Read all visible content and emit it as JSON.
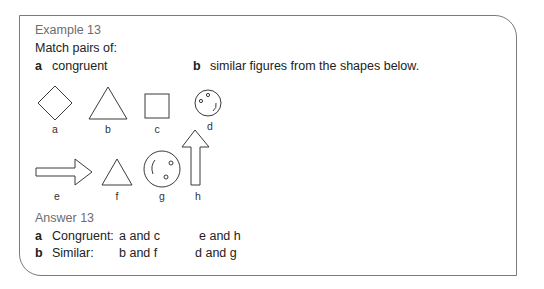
{
  "example": {
    "title": "Example 13",
    "prompt": "Match pairs of:",
    "parts": [
      {
        "label": "a",
        "text": "congruent"
      },
      {
        "label": "b",
        "text": "similar figures from the shapes below."
      }
    ]
  },
  "figures": [
    {
      "id": "a",
      "shape": "diamond"
    },
    {
      "id": "b",
      "shape": "triangle-large"
    },
    {
      "id": "c",
      "shape": "square"
    },
    {
      "id": "d",
      "shape": "face-small"
    },
    {
      "id": "e",
      "shape": "arrow-right"
    },
    {
      "id": "f",
      "shape": "triangle-small"
    },
    {
      "id": "g",
      "shape": "face-large"
    },
    {
      "id": "h",
      "shape": "arrow-up"
    }
  ],
  "answer": {
    "title": "Answer 13",
    "rows": [
      {
        "label": "a",
        "name": "Congruent:",
        "pair1": "a and c",
        "pair2": "e and h"
      },
      {
        "label": "b",
        "name": "Similar:",
        "pair1": "b and f",
        "pair2": "d and g"
      }
    ]
  }
}
